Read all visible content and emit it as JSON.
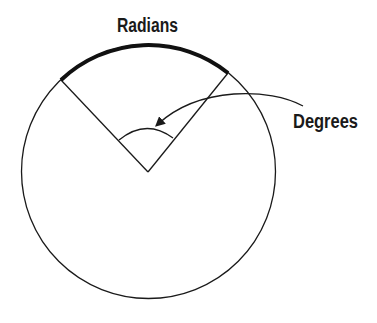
{
  "diagram": {
    "labels": {
      "radians": "Radians",
      "degrees": "Degrees"
    },
    "colors": {
      "stroke": "#1a1a1a",
      "background": "#ffffff"
    },
    "geometry": {
      "circle": {
        "cx": 148.5,
        "cy": 171.5,
        "r": 127
      },
      "vertex": {
        "x": 148,
        "y": 172
      },
      "radius_left_end": {
        "x": 61,
        "y": 80
      },
      "radius_right_end": {
        "x": 228,
        "y": 73
      }
    }
  }
}
